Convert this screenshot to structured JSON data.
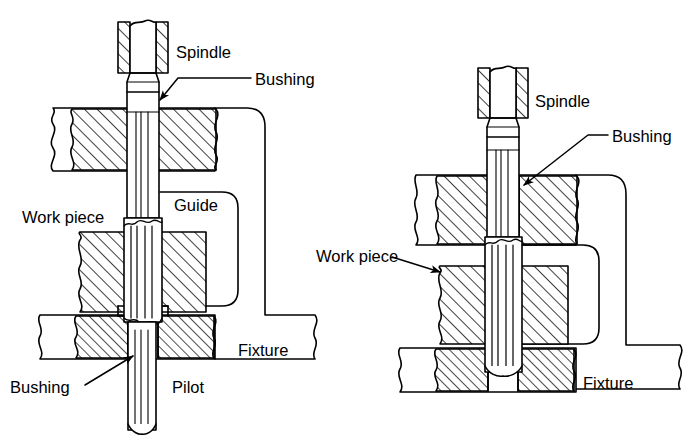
{
  "figure": {
    "title": "",
    "type": "technical-cross-section-diagram",
    "background_color": "#ffffff",
    "line_color": "#000000",
    "hatch_color": "#000000",
    "panels": [
      {
        "id": "left",
        "name": "piloted-tool-arrangement",
        "description": "Tool guided by an upper guide bushing and a lower pilot bushing in the fixture",
        "labels": [
          {
            "key": "spindle",
            "text": "Spindle",
            "x": 176,
            "y": 58,
            "anchor": "start",
            "leader": false
          },
          {
            "key": "bushing_top",
            "text": "Bushing",
            "x": 218,
            "y": 85,
            "anchor": "start",
            "leader": true
          },
          {
            "key": "guide",
            "text": "Guide",
            "x": 174,
            "y": 205,
            "anchor": "start",
            "leader": false
          },
          {
            "key": "workpiece",
            "text": "Work piece",
            "x": 22,
            "y": 217,
            "anchor": "start",
            "leader": false
          },
          {
            "key": "fixture",
            "text": "Fixture",
            "x": 238,
            "y": 350,
            "anchor": "start",
            "leader": false
          },
          {
            "key": "bushing_bottom",
            "text": "Bushing",
            "x": 10,
            "y": 393,
            "anchor": "start",
            "leader": true
          },
          {
            "key": "pilot",
            "text": "Pilot",
            "x": 172,
            "y": 393,
            "anchor": "start",
            "leader": false
          }
        ]
      },
      {
        "id": "right",
        "name": "unpiloted-tool-arrangement",
        "description": "Tool guided only by a bushing mounted in the upper fixture plate above the work piece",
        "labels": [
          {
            "key": "spindle",
            "text": "Spindle",
            "x": 535,
            "y": 101,
            "anchor": "start",
            "leader": false
          },
          {
            "key": "bushing",
            "text": "Bushing",
            "x": 575,
            "y": 142,
            "anchor": "start",
            "leader": true
          },
          {
            "key": "workpiece",
            "text": "Work piece",
            "x": 316,
            "y": 262,
            "anchor": "start",
            "leader": true
          },
          {
            "key": "fixture",
            "text": "Fixture",
            "x": 583,
            "y": 383,
            "anchor": "start",
            "leader": false
          }
        ]
      }
    ]
  }
}
